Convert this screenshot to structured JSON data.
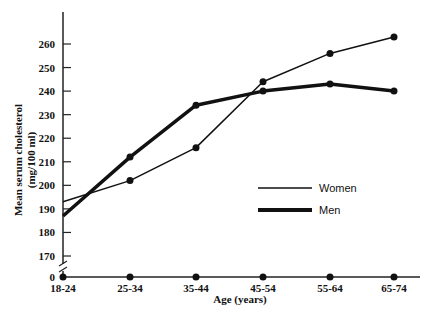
{
  "chart_data": {
    "type": "line",
    "title": "",
    "xlabel": "Age (years)",
    "ylabel": "Mean serum cholesterol (mg/100 ml)",
    "ylabel_lines": [
      "Mean serum cholesterol",
      "(mg/100 ml)"
    ],
    "categories": [
      "18-24",
      "25-34",
      "35-44",
      "45-54",
      "55-64",
      "65-74"
    ],
    "y_ticks": [
      0,
      170,
      180,
      190,
      200,
      210,
      220,
      230,
      240,
      250,
      260
    ],
    "ylim": [
      170,
      268
    ],
    "axis_break": true,
    "grid": false,
    "legend_position": "inside-right",
    "series": [
      {
        "name": "Women",
        "style": "thin",
        "values": [
          193,
          202,
          216,
          244,
          256,
          263
        ]
      },
      {
        "name": "Men",
        "style": "thick",
        "values": [
          187,
          212,
          234,
          240,
          243,
          240
        ]
      }
    ]
  }
}
